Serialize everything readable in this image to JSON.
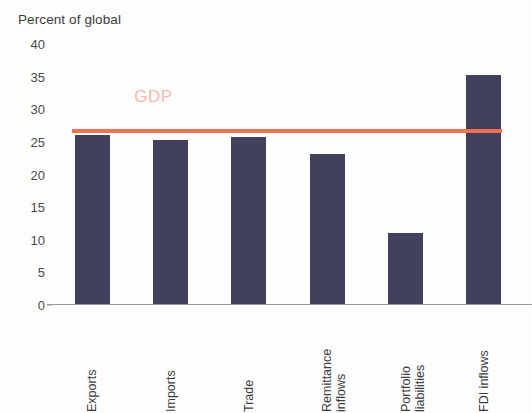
{
  "chart_data": {
    "type": "bar",
    "title": "Percent of global",
    "xlabel": "",
    "ylabel": "Percent of global",
    "ylim": [
      0,
      40
    ],
    "yticks": [
      0,
      5,
      10,
      15,
      20,
      25,
      30,
      35,
      40
    ],
    "ytick_labels": [
      "0",
      "5",
      "10",
      "15",
      "20",
      "25",
      "30",
      "35",
      "40"
    ],
    "grid": false,
    "legend": "none",
    "bar_color": "#41415e",
    "categories": [
      "Exports",
      "Imports",
      "Trade",
      "Remittance inflows",
      "Portfolio liabilities",
      "FDI inflows"
    ],
    "values": [
      26.0,
      25.3,
      25.8,
      23.2,
      11.0,
      35.2
    ],
    "annotations": [
      {
        "name": "gdp-reference-line",
        "label": "GDP",
        "value": 26.7,
        "color": "#f2714f",
        "label_color": "#f6b9ae",
        "type": "horizontal-line"
      }
    ]
  },
  "axis": {
    "caption": "Percent of global",
    "ticks": [
      {
        "label": "40",
        "value": 40
      },
      {
        "label": "35",
        "value": 35
      },
      {
        "label": "30",
        "value": 30
      },
      {
        "label": "25",
        "value": 25
      },
      {
        "label": "20",
        "value": 20
      },
      {
        "label": "15",
        "value": 15
      },
      {
        "label": "10",
        "value": 10
      },
      {
        "label": "5",
        "value": 5
      },
      {
        "label": "0",
        "value": 0
      }
    ]
  },
  "categories": [
    {
      "line1": "Exports",
      "line2": ""
    },
    {
      "line1": "Imports",
      "line2": ""
    },
    {
      "line1": "Trade",
      "line2": ""
    },
    {
      "line1": "Remittance",
      "line2": "inflows"
    },
    {
      "line1": "Portfolio",
      "line2": "liabilities"
    },
    {
      "line1": "FDI inflows",
      "line2": ""
    }
  ],
  "gdp": {
    "label": "GDP"
  }
}
